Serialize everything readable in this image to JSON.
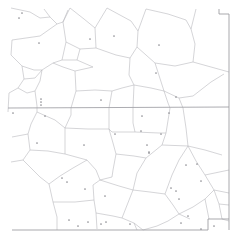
{
  "figure": {
    "title": "",
    "kind": "voronoi-tessellation-map",
    "width": 243,
    "height": 247,
    "background_color": "#ffffff",
    "edge_color": "#b9b9bd",
    "boundary_color": "#9a9a9e",
    "axis_color": "#a3a3a8",
    "point_color": "#8e8e93",
    "point_radius": 0.85
  },
  "chart_data": {
    "type": "scatter",
    "title": "",
    "xlabel": "",
    "ylabel": "",
    "grid": false,
    "legend": null,
    "xlim": [
      0,
      243
    ],
    "ylim": [
      0,
      247
    ],
    "series": [
      {
        "name": "seed-points",
        "x": [
          22,
          19,
          39,
          90,
          114,
          159,
          156,
          41,
          101,
          41,
          41,
          13,
          45,
          37,
          84,
          142,
          169,
          176,
          141,
          161,
          115,
          147,
          149,
          197,
          176,
          62,
          85,
          105,
          67,
          88,
          130,
          101,
          171,
          201,
          179,
          188,
          106,
          78,
          201,
          149,
          186,
          69,
          181,
          214
        ],
        "y": [
          13,
          18,
          43,
          39,
          36,
          45,
          73,
          99,
          100,
          102,
          105,
          113,
          116,
          143,
          145,
          116,
          113,
          97,
          131,
          134,
          134,
          145,
          152,
          164,
          191,
          178,
          189,
          196,
          182,
          222,
          224,
          224,
          188,
          181,
          199,
          216,
          222,
          226,
          229,
          153,
          165,
          220,
          223,
          226
        ]
      }
    ],
    "points_count": 44
  },
  "overlays": {
    "horizontal_axis_y": 108,
    "right_border_x": 229,
    "right_border_notch_x": 219,
    "right_border_notch_y": 14,
    "bottom_border_y": 230,
    "bottom_border_step_x": 208,
    "bottom_border_step_y": 219
  },
  "labels": {
    "caption": "",
    "footnote": ""
  }
}
